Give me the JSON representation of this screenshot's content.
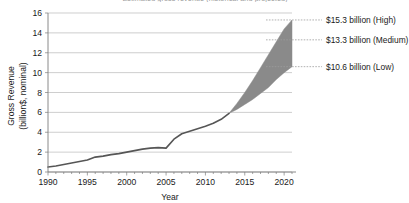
{
  "chart_data": {
    "type": "area",
    "title": "Estimated gross revenue (historical and projected)",
    "xlabel": "Year",
    "ylabel_line1": "Gross Revenue",
    "ylabel_line2": "(billion$, nominal)",
    "xlim": [
      1990,
      2021
    ],
    "ylim": [
      0,
      16
    ],
    "xticks": [
      1990,
      1995,
      2000,
      2005,
      2010,
      2015,
      2020
    ],
    "xtick_labels": [
      "1990",
      "1995",
      "2000",
      "2005",
      "2010",
      "2015",
      "2020"
    ],
    "yticks": [
      0,
      2,
      4,
      6,
      8,
      10,
      12,
      14,
      16
    ],
    "ytick_labels": [
      "0",
      "2",
      "4",
      "6",
      "8",
      "10",
      "12",
      "14",
      "16"
    ],
    "grid": "horizontal",
    "legend": "none",
    "minor_xticks_every": 1,
    "series": [
      {
        "name": "Historical gross revenue",
        "type": "line",
        "color": "#565656",
        "x": [
          1990,
          1991,
          1992,
          1993,
          1994,
          1995,
          1996,
          1997,
          1998,
          1999,
          2000,
          2001,
          2002,
          2003,
          2004,
          2005,
          2006,
          2007,
          2008,
          2009,
          2010,
          2011,
          2012,
          2013
        ],
        "values": [
          0.5,
          0.6,
          0.75,
          0.9,
          1.05,
          1.2,
          1.5,
          1.6,
          1.75,
          1.85,
          2.0,
          2.15,
          2.3,
          2.4,
          2.45,
          2.4,
          3.3,
          3.85,
          4.1,
          4.35,
          4.6,
          4.9,
          5.3,
          5.9
        ]
      },
      {
        "name": "Projection band - Low",
        "type": "line",
        "color": "#8a8a8a",
        "x": [
          2013,
          2014,
          2015,
          2016,
          2017,
          2018,
          2019,
          2020,
          2021
        ],
        "values": [
          5.9,
          6.3,
          6.8,
          7.3,
          7.9,
          8.5,
          9.3,
          10.0,
          10.6
        ]
      },
      {
        "name": "Projection band - High",
        "type": "line",
        "color": "#8a8a8a",
        "x": [
          2013,
          2014,
          2015,
          2016,
          2017,
          2018,
          2019,
          2020,
          2021
        ],
        "values": [
          5.9,
          6.9,
          8.0,
          9.2,
          10.5,
          11.8,
          13.1,
          14.4,
          15.3
        ]
      }
    ],
    "band": {
      "name": "Projection range",
      "fill": "#8a8a8a",
      "start_year": 2013,
      "end_year": 2021
    },
    "annotations": [
      {
        "label": "$15.3 billion (High)",
        "value": 15.3,
        "level": "High"
      },
      {
        "label": "$13.3 billion (Medium)",
        "value": 13.3,
        "level": "Medium"
      },
      {
        "label": "$10.6 billion (Low)",
        "value": 10.6,
        "level": "Low"
      }
    ]
  }
}
